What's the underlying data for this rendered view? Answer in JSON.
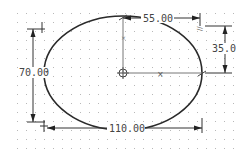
{
  "drawing": {
    "type": "ellipse-sketch",
    "colors": {
      "background": "#ffffff",
      "grid_dot": "#b8b8b8",
      "geometry": "#2a2a2a",
      "dimension": "#333333",
      "centerline": "#555555"
    },
    "ellipse": {
      "cx": 123,
      "cy": 73,
      "rx": 79,
      "ry": 57
    },
    "dimensions": {
      "major_axis": {
        "label": "110.00"
      },
      "minor_axis": {
        "label": "70.00"
      },
      "semi_major": {
        "label": "55.00"
      },
      "semi_minor": {
        "label": "35.0"
      }
    },
    "constraint_symbols": {
      "vertical": "⊥",
      "horizontal_mark": "×",
      "parallel_mark": "//"
    }
  }
}
